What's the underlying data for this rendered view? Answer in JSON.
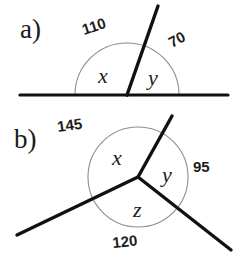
{
  "page": {
    "background_color": "#ffffff",
    "ink_color": "#111111",
    "arc_color": "#8d8d8d"
  },
  "problems": [
    {
      "id": "a",
      "label": "a)",
      "description": "straight line split by one ray into two angles",
      "vertex": {
        "x": 127,
        "y": 95
      },
      "arc_radius": 52,
      "variables": [
        {
          "name": "x",
          "text": "x",
          "x": 98,
          "y": 83
        },
        {
          "name": "y",
          "text": "y",
          "x": 148,
          "y": 85
        }
      ],
      "measures": [
        {
          "name": "110",
          "text": "110",
          "x": 84,
          "y": 35,
          "rotation": -18
        },
        {
          "name": "70",
          "text": "70",
          "x": 172,
          "y": 48,
          "rotation": -28
        }
      ],
      "rays": [
        {
          "name": "horizontal-left",
          "x1": 20,
          "y1": 95,
          "x2": 127,
          "y2": 95,
          "width": 3.2
        },
        {
          "name": "horizontal-right",
          "x1": 127,
          "y1": 95,
          "x2": 228,
          "y2": 95,
          "width": 3.2
        },
        {
          "name": "slanted-up-right",
          "x1": 127,
          "y1": 95,
          "x2": 158,
          "y2": 6,
          "width": 3.4
        }
      ]
    },
    {
      "id": "b",
      "label": "b)",
      "description": "three rays from a common vertex forming three angles",
      "vertex": {
        "x": 138,
        "y": 177
      },
      "arc_radius": 50,
      "variables": [
        {
          "name": "x",
          "text": "x",
          "x": 112,
          "y": 165
        },
        {
          "name": "y",
          "text": "y",
          "x": 162,
          "y": 182
        },
        {
          "name": "z",
          "text": "z",
          "x": 133,
          "y": 217
        }
      ],
      "measures": [
        {
          "name": "145",
          "text": "145",
          "x": 58,
          "y": 132,
          "rotation": -8
        },
        {
          "name": "95",
          "text": "95",
          "x": 193,
          "y": 172,
          "rotation": 0
        },
        {
          "name": "120",
          "text": "120",
          "x": 113,
          "y": 248,
          "rotation": -6
        }
      ],
      "rays": [
        {
          "name": "ray-up-right",
          "x1": 138,
          "y1": 177,
          "x2": 172,
          "y2": 116,
          "width": 3.4
        },
        {
          "name": "ray-lower-left",
          "x1": 138,
          "y1": 177,
          "x2": 17,
          "y2": 235,
          "width": 3.4
        },
        {
          "name": "ray-lower-right",
          "x1": 138,
          "y1": 177,
          "x2": 231,
          "y2": 250,
          "width": 3.4
        }
      ]
    }
  ]
}
